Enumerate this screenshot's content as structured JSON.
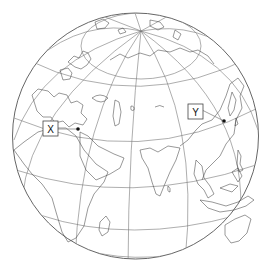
{
  "map": {
    "type": "orthographic globe",
    "view_center": "Middle East / Central Asia, tilted showing North Pole",
    "graticule": true,
    "colors": {
      "background": "#ffffff",
      "outline": "#555555",
      "graticule": "#777777",
      "coastline": "#444444",
      "marker": "#111111"
    },
    "markers": [
      {
        "id": "X",
        "label": "X",
        "location_hint": "near eastern Mediterranean / Suez (Egypt)"
      },
      {
        "id": "Y",
        "label": "Y",
        "location_hint": "east China coast (near Shanghai)"
      }
    ]
  }
}
